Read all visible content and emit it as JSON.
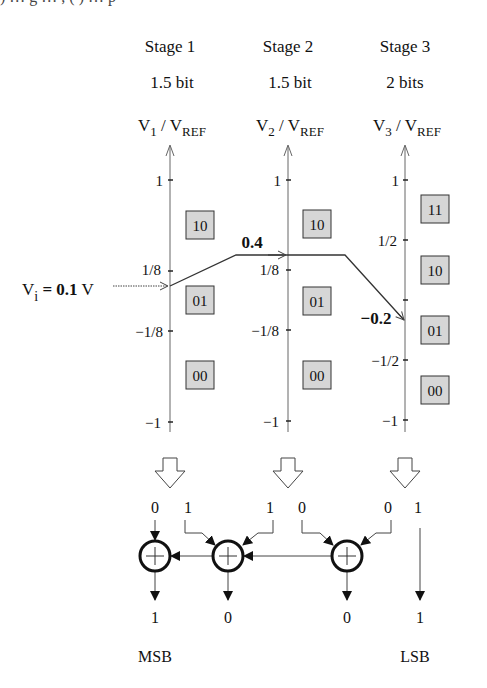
{
  "caption_fragment": ") … g … , ( ) … p",
  "stages": [
    {
      "name": "Stage 1",
      "resolution": "1.5 bit",
      "axis_label": {
        "main": "V",
        "sub": "1",
        "sep": " / V",
        "ref": "REF"
      },
      "ticks": [
        {
          "label": "1",
          "y": 180
        },
        {
          "label": "1/8",
          "y": 271
        },
        {
          "label": "−1/8",
          "y": 330
        },
        {
          "label": "−1",
          "y": 422
        }
      ],
      "codes": [
        {
          "label": "10",
          "y": 224
        },
        {
          "label": "01",
          "y": 299
        },
        {
          "label": "00",
          "y": 375
        }
      ],
      "output_bits": [
        "0",
        "1"
      ]
    },
    {
      "name": "Stage 2",
      "resolution": "1.5 bit",
      "axis_label": {
        "main": "V",
        "sub": "2",
        "sep": " / V",
        "ref": "REF"
      },
      "ticks": [
        {
          "label": "1",
          "y": 180
        },
        {
          "label": "1/8",
          "y": 270
        },
        {
          "label": "−1/8",
          "y": 330
        },
        {
          "label": "−1",
          "y": 421
        }
      ],
      "codes": [
        {
          "label": "10",
          "y": 226
        },
        {
          "label": "01",
          "y": 301
        },
        {
          "label": "00",
          "y": 376
        }
      ],
      "output_bits": [
        "1",
        "0"
      ]
    },
    {
      "name": "Stage 3",
      "resolution": "2 bits",
      "axis_label": {
        "main": "V",
        "sub": "3",
        "sep": " / V",
        "ref": "REF"
      },
      "ticks": [
        {
          "label": "1",
          "y": 180
        },
        {
          "label": "1/2",
          "y": 240
        },
        {
          "label": "",
          "y": 300
        },
        {
          "label": "−1/2",
          "y": 360
        },
        {
          "label": "−1",
          "y": 420
        }
      ],
      "codes": [
        {
          "label": "11",
          "y": 209
        },
        {
          "label": "10",
          "y": 270
        },
        {
          "label": "01",
          "y": 330
        },
        {
          "label": "00",
          "y": 390
        }
      ],
      "output_bits": [
        "0",
        "1"
      ]
    }
  ],
  "input": {
    "prefix": "V",
    "sub": "i",
    "eq": " = ",
    "value": "0.1",
    "unit": " V"
  },
  "residues": [
    {
      "label": "0.4",
      "stage": 2
    },
    {
      "label": "−0.2",
      "stage": 3
    }
  ],
  "adder_symbol": "+",
  "final_bits": [
    "1",
    "0",
    "0",
    "1"
  ],
  "msb_label": "MSB",
  "lsb_label": "LSB",
  "colors": {
    "line": "#222222",
    "axis": "#666666",
    "code_box_fill": "#d6d6d6",
    "code_box_border": "#333333"
  }
}
